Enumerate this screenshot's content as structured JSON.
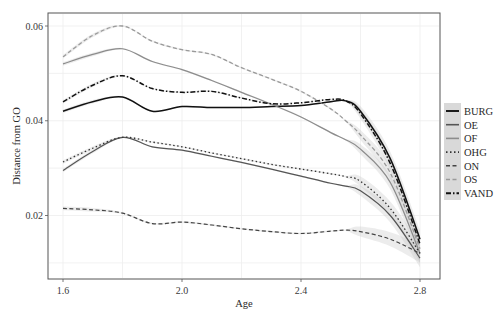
{
  "chart_data": {
    "type": "line",
    "title": "",
    "xlabel": "Age",
    "ylabel": "Distance from GO",
    "xlim": [
      1.55,
      2.85
    ],
    "ylim": [
      0.0075,
      0.0625
    ],
    "xticks": [
      1.6,
      2.0,
      2.4,
      2.8
    ],
    "xtick_labels": [
      "1.6",
      "2.0",
      "2.4",
      "2.8"
    ],
    "yticks": [
      0.02,
      0.04,
      0.06
    ],
    "ytick_labels": [
      "0.02",
      "0.04",
      "0.06"
    ],
    "grid": true,
    "legend_position": "right",
    "x": [
      1.6,
      1.7,
      1.8,
      1.9,
      2.0,
      2.1,
      2.2,
      2.3,
      2.4,
      2.5,
      2.55,
      2.6,
      2.7,
      2.8
    ],
    "series": [
      {
        "name": "BURG",
        "color": "#111111",
        "dash": "solid",
        "width": 1.5,
        "values": [
          0.042,
          0.044,
          0.045,
          0.042,
          0.043,
          0.0428,
          0.0428,
          0.043,
          0.0432,
          0.044,
          0.0442,
          0.042,
          0.032,
          0.015
        ]
      },
      {
        "name": "OE",
        "color": "#555555",
        "dash": "solid",
        "width": 1.2,
        "values": [
          0.0295,
          0.0335,
          0.0365,
          0.0345,
          0.0338,
          0.0325,
          0.0312,
          0.0298,
          0.0283,
          0.0268,
          0.0262,
          0.0252,
          0.02,
          0.011
        ]
      },
      {
        "name": "OF",
        "color": "#8c8c8c",
        "dash": "solid",
        "width": 1.2,
        "values": [
          0.052,
          0.054,
          0.0552,
          0.0525,
          0.0508,
          0.0485,
          0.046,
          0.0435,
          0.0408,
          0.0375,
          0.036,
          0.034,
          0.027,
          0.012
        ]
      },
      {
        "name": "OHG",
        "color": "#333333",
        "dash": "dotted",
        "width": 1.3,
        "values": [
          0.0313,
          0.0342,
          0.0365,
          0.0355,
          0.0345,
          0.0332,
          0.032,
          0.0308,
          0.0298,
          0.0288,
          0.0282,
          0.0272,
          0.0215,
          0.012
        ]
      },
      {
        "name": "ON",
        "color": "#444444",
        "dash": "dashed",
        "width": 1.2,
        "values": [
          0.0215,
          0.0212,
          0.0205,
          0.0183,
          0.0186,
          0.018,
          0.0172,
          0.0166,
          0.0162,
          0.0167,
          0.0169,
          0.0166,
          0.015,
          0.012
        ]
      },
      {
        "name": "OS",
        "color": "#9a9a9a",
        "dash": "dashed",
        "width": 1.3,
        "values": [
          0.0535,
          0.058,
          0.06,
          0.0568,
          0.055,
          0.054,
          0.0512,
          0.0488,
          0.0462,
          0.0425,
          0.04,
          0.037,
          0.029,
          0.013
        ]
      },
      {
        "name": "VAND",
        "color": "#111111",
        "dash": "dashdot",
        "width": 1.5,
        "values": [
          0.044,
          0.0475,
          0.0495,
          0.0468,
          0.046,
          0.0462,
          0.0448,
          0.0436,
          0.0438,
          0.0445,
          0.0442,
          0.0415,
          0.031,
          0.014
        ]
      }
    ]
  },
  "legend": {
    "items": [
      "BURG",
      "OE",
      "OF",
      "OHG",
      "ON",
      "OS",
      "VAND"
    ]
  },
  "axes": {
    "xlabel": "Age",
    "ylabel": "Distance from GO",
    "xtick_labels": [
      "1.6",
      "2.0",
      "2.4",
      "2.8"
    ],
    "ytick_labels": [
      "0.02",
      "0.04",
      "0.06"
    ]
  }
}
